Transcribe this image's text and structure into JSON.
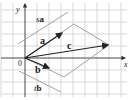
{
  "diagram": {
    "type": "vector-parallelogram",
    "axes": {
      "x_label": "x",
      "y_label": "y",
      "origin_label": "0"
    },
    "vectors": [
      {
        "name": "a",
        "from": [
          25,
          58
        ],
        "to": [
          63,
          33
        ]
      },
      {
        "name": "b",
        "from": [
          25,
          58
        ],
        "to": [
          50,
          68
        ]
      },
      {
        "name": "c",
        "from": [
          25,
          58
        ],
        "to": [
          109,
          45
        ]
      }
    ],
    "lines": [
      {
        "name": "sa",
        "label_scalar": "s",
        "label_vector": "a"
      },
      {
        "name": "tb",
        "label_scalar": "t",
        "label_vector": "b"
      }
    ],
    "labels": {
      "y": "y",
      "x": "x",
      "origin": "0",
      "a": "a",
      "b": "b",
      "c": "c",
      "sa_s": "s",
      "sa_a": "a",
      "tb_t": "t",
      "tb_b": "b"
    },
    "colors": {
      "grid": "#c8c8c8",
      "vector": "#222222",
      "parallelogram": "#999999",
      "axis": "#333333"
    }
  }
}
